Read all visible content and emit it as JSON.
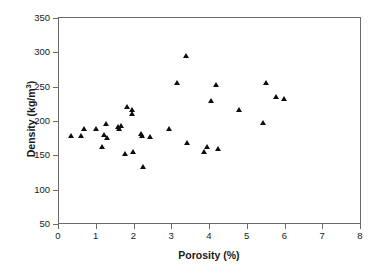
{
  "chart_data": {
    "type": "scatter",
    "title": "",
    "xlabel": "Porosity (%)",
    "ylabel": "Density (kg/m3)",
    "ylabel_html": "Density (kg/m<sup>3</sup>)",
    "xlim": [
      0,
      8
    ],
    "ylim": [
      50,
      350
    ],
    "xticks": [
      0,
      1,
      2,
      3,
      4,
      5,
      6,
      7,
      8
    ],
    "yticks": [
      50,
      100,
      150,
      200,
      250,
      300,
      350
    ],
    "grid": false,
    "legend": null,
    "marker": "filled-triangle",
    "marker_color": "#0d0d0d",
    "series": [
      {
        "name": "samples",
        "points": [
          [
            0.35,
            178
          ],
          [
            0.62,
            178
          ],
          [
            0.7,
            189
          ],
          [
            1.02,
            189
          ],
          [
            1.18,
            162
          ],
          [
            1.22,
            180
          ],
          [
            1.28,
            196
          ],
          [
            1.3,
            176
          ],
          [
            1.6,
            191
          ],
          [
            1.63,
            189
          ],
          [
            1.66,
            193
          ],
          [
            1.78,
            153
          ],
          [
            1.82,
            221
          ],
          [
            1.95,
            216
          ],
          [
            1.97,
            211
          ],
          [
            1.99,
            156
          ],
          [
            2.2,
            181
          ],
          [
            2.24,
            178
          ],
          [
            2.26,
            134
          ],
          [
            2.44,
            177
          ],
          [
            2.94,
            189
          ],
          [
            3.16,
            256
          ],
          [
            3.4,
            295
          ],
          [
            3.42,
            168
          ],
          [
            3.88,
            156
          ],
          [
            3.94,
            162
          ],
          [
            4.06,
            229
          ],
          [
            4.2,
            253
          ],
          [
            4.24,
            160
          ],
          [
            4.8,
            217
          ],
          [
            5.44,
            198
          ],
          [
            5.5,
            256
          ],
          [
            5.78,
            235
          ],
          [
            5.98,
            233
          ]
        ]
      }
    ]
  },
  "axes": {
    "x_tick_labels": [
      "0",
      "1",
      "2",
      "3",
      "4",
      "5",
      "6",
      "7",
      "8"
    ],
    "y_tick_labels": [
      "50",
      "100",
      "150",
      "200",
      "250",
      "300",
      "350"
    ]
  }
}
